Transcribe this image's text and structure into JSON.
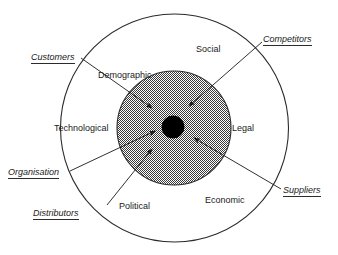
{
  "diagram": {
    "type": "concentric-circles",
    "background_color": "#ffffff",
    "line_color": "#2b2b2b",
    "inner_fill_color": "#808080",
    "core_color": "#000000",
    "macro_environment": {
      "name": "outer-ring",
      "labels": [
        {
          "id": "social",
          "text": "Social",
          "x": 196,
          "y": 45
        },
        {
          "id": "demographic",
          "text": "Demographic",
          "x": 98,
          "y": 71
        },
        {
          "id": "technological",
          "text": "Technological",
          "x": 54,
          "y": 124
        },
        {
          "id": "legal",
          "text": "Legal",
          "x": 232,
          "y": 124
        },
        {
          "id": "political",
          "text": "Political",
          "x": 119,
          "y": 202
        },
        {
          "id": "economic",
          "text": "Economic",
          "x": 205,
          "y": 196
        }
      ]
    },
    "micro_environment": {
      "name": "inner-shaded-circle",
      "labels": [
        {
          "id": "customers",
          "text": "Customers",
          "x": 31,
          "y": 53
        },
        {
          "id": "competitors",
          "text": "Competitors",
          "x": 263,
          "y": 35
        },
        {
          "id": "organisation",
          "text": "Organisation",
          "x": 8,
          "y": 168
        },
        {
          "id": "distributors",
          "text": "Distributors",
          "x": 33,
          "y": 209
        },
        {
          "id": "suppliers",
          "text": "Suppliers",
          "x": 283,
          "y": 186
        }
      ]
    },
    "geometry": {
      "outer_circle": {
        "cx": 174.5,
        "cy": 128,
        "r": 114
      },
      "inner_circle": {
        "cx": 174,
        "cy": 128,
        "r": 57
      },
      "core_circle": {
        "cx": 173,
        "cy": 127,
        "r": 11
      }
    },
    "arrows": [
      {
        "id": "customers-arrow",
        "from": [
          81,
          58
        ],
        "to": [
          152,
          108
        ]
      },
      {
        "id": "competitors-arrow",
        "from": [
          262,
          42
        ],
        "to": [
          189,
          106
        ]
      },
      {
        "id": "organisation-arrow",
        "from": [
          70,
          171
        ],
        "to": [
          155,
          131
        ]
      },
      {
        "id": "distributors-arrow",
        "from": [
          107,
          205
        ],
        "to": [
          152,
          149
        ]
      },
      {
        "id": "suppliers-arrow",
        "from": [
          281,
          189
        ],
        "to": [
          194,
          138
        ]
      }
    ]
  }
}
